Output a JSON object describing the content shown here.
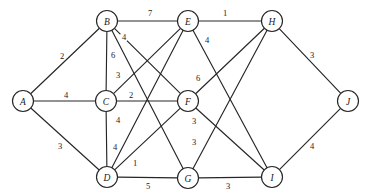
{
  "figure": {
    "type": "weighted-undirected-graph",
    "width": 367,
    "height": 196,
    "background_color": "#ffffff",
    "stroke_color": "#262626",
    "text_color": "#1a1a1a",
    "node_radius": 10.5
  },
  "nodes": [
    {
      "id": "A",
      "label": "A",
      "x": 23,
      "y": 101
    },
    {
      "id": "B",
      "label": "B",
      "x": 107,
      "y": 21
    },
    {
      "id": "C",
      "label": "C",
      "x": 106,
      "y": 101
    },
    {
      "id": "D",
      "label": "D",
      "x": 107,
      "y": 177
    },
    {
      "id": "E",
      "label": "E",
      "x": 188,
      "y": 21
    },
    {
      "id": "F",
      "label": "F",
      "x": 188,
      "y": 101
    },
    {
      "id": "G",
      "label": "G",
      "x": 188,
      "y": 178
    },
    {
      "id": "H",
      "label": "H",
      "x": 272,
      "y": 21
    },
    {
      "id": "I",
      "label": "I",
      "x": 272,
      "y": 177
    },
    {
      "id": "J",
      "label": "J",
      "x": 348,
      "y": 101
    }
  ],
  "edges": [
    {
      "from": "A",
      "to": "B",
      "weight": "2",
      "lx": 62,
      "ly": 56
    },
    {
      "from": "A",
      "to": "C",
      "weight": "4",
      "lx": 66,
      "ly": 95
    },
    {
      "from": "A",
      "to": "D",
      "weight": "3",
      "lx": 60,
      "ly": 146
    },
    {
      "from": "B",
      "to": "E",
      "weight": "7",
      "lx": 150,
      "ly": 13
    },
    {
      "from": "B",
      "to": "F",
      "weight": "4",
      "lx": 124,
      "ly": 37
    },
    {
      "from": "B",
      "to": "C",
      "weight": "6",
      "lx": 113,
      "ly": 55
    },
    {
      "from": "B",
      "to": "G",
      "weight": "3",
      "lx": 118,
      "ly": 75
    },
    {
      "from": "C",
      "to": "F",
      "weight": "2",
      "lx": 131,
      "ly": 95
    },
    {
      "from": "C",
      "to": "E",
      "weight": "4",
      "lx": 118,
      "ly": 120
    },
    {
      "from": "C",
      "to": "D",
      "weight": "4",
      "lx": 115,
      "ly": 147
    },
    {
      "from": "D",
      "to": "E",
      "weight": "1",
      "lx": 135,
      "ly": 163
    },
    {
      "from": "D",
      "to": "F",
      "weight": "3",
      "lx": 194,
      "ly": 142
    },
    {
      "from": "D",
      "to": "G",
      "weight": "5",
      "lx": 148,
      "ly": 186
    },
    {
      "from": "E",
      "to": "H",
      "weight": "1",
      "lx": 225,
      "ly": 13
    },
    {
      "from": "E",
      "to": "I",
      "weight": "4",
      "lx": 207,
      "ly": 40
    },
    {
      "from": "F",
      "to": "H",
      "weight": "6",
      "lx": 198,
      "ly": 78
    },
    {
      "from": "F",
      "to": "I",
      "weight": "3",
      "lx": 194,
      "ly": 121
    },
    {
      "from": "G",
      "to": "H",
      "weight": "",
      "lx": 0,
      "ly": 0
    },
    {
      "from": "G",
      "to": "I",
      "weight": "3",
      "lx": 228,
      "ly": 186
    },
    {
      "from": "H",
      "to": "J",
      "weight": "3",
      "lx": 312,
      "ly": 55
    },
    {
      "from": "I",
      "to": "J",
      "weight": "4",
      "lx": 312,
      "ly": 146
    }
  ]
}
